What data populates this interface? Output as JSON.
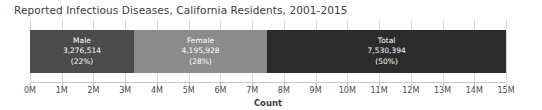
{
  "chart_data": {
    "type": "bar",
    "orientation": "horizontal-stacked",
    "title": "Reported Infectious Diseases, California Residents, 2001-2015",
    "xlabel": "Count",
    "ylabel": "",
    "xlim": [
      0,
      15000000
    ],
    "grid": true,
    "legend": "none",
    "tick_labels": [
      "0M",
      "1M",
      "2M",
      "3M",
      "4M",
      "5M",
      "6M",
      "7M",
      "8M",
      "9M",
      "10M",
      "11M",
      "12M",
      "13M",
      "14M",
      "15M"
    ],
    "tick_values": [
      0,
      1000000,
      2000000,
      3000000,
      4000000,
      5000000,
      6000000,
      7000000,
      8000000,
      9000000,
      10000000,
      11000000,
      12000000,
      13000000,
      14000000,
      15000000
    ],
    "categories": [
      "Male",
      "Female",
      "Total"
    ],
    "values": [
      3276514,
      4195928,
      7530394
    ],
    "segments": [
      {
        "name": "Male",
        "value": 3276514,
        "value_label": "3,276,514",
        "percent_label": "(22%)",
        "percent": 22,
        "color": "#4b4b4b"
      },
      {
        "name": "Female",
        "value": 4195928,
        "value_label": "4,195,928",
        "percent_label": "(28%)",
        "percent": 28,
        "color": "#8b8b8b"
      },
      {
        "name": "Total",
        "value": 7530394,
        "value_label": "7,530,394",
        "percent_label": "(50%)",
        "percent": 50,
        "color": "#2b2b2b"
      }
    ]
  }
}
